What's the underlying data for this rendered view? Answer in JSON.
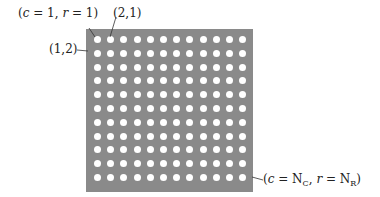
{
  "figure": {
    "grid": {
      "columns": 12,
      "rows": 11,
      "background": "#8a8a8a",
      "dot_color": "#ffffff"
    },
    "labels": {
      "first_pixel": "(c = 1, r = 1)",
      "second_column": "(2,1)",
      "second_row": "(1,2)",
      "last_pixel": "(c = N_C, r = N_R)"
    }
  }
}
